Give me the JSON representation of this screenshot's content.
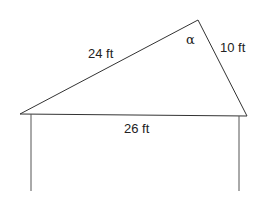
{
  "diagram": {
    "type": "triangle-roof",
    "line_color": "#333333",
    "vertices": {
      "top": [
        198,
        20
      ],
      "left": [
        20,
        114
      ],
      "right": [
        247,
        116
      ]
    },
    "posts": [
      {
        "x1": 31,
        "y1": 114,
        "x2": 31,
        "y2": 191
      },
      {
        "x1": 239,
        "y1": 116,
        "x2": 239,
        "y2": 191
      }
    ],
    "labels": {
      "left_side": "24 ft",
      "right_side": "10 ft",
      "base": "26 ft",
      "angle": "α"
    }
  }
}
